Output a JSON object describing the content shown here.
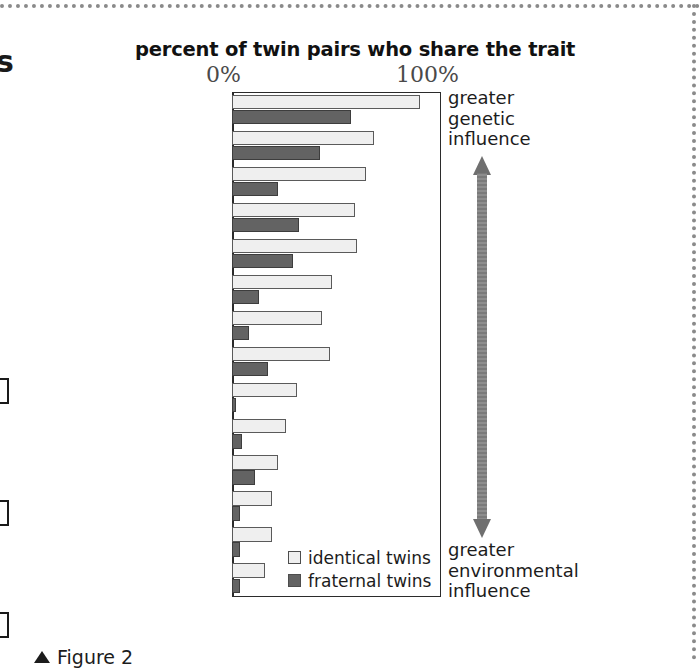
{
  "page": {
    "left_fragment_letter": "s",
    "caption": "Figure 2",
    "caption_icon": "up-triangle-icon"
  },
  "annotations": {
    "top": "greater\ngenetic\ninfluence",
    "top_lines": [
      "greater",
      "genetic",
      "influence"
    ],
    "bottom_lines": [
      "greater",
      "environmental",
      "influence"
    ],
    "arrow": "double-headed-vertical-arrow"
  },
  "legend": {
    "position": "inside-bottom-right",
    "entries": [
      {
        "label": "identical twins",
        "color": "#efefef",
        "key": "identical"
      },
      {
        "label": "fraternal twins",
        "color": "#636363",
        "key": "fraternal"
      }
    ]
  },
  "chart_data": {
    "type": "bar",
    "orientation": "horizontal",
    "title": "percent of twin pairs who share the trait",
    "xlabel": "",
    "ylabel": "",
    "xlim": [
      0,
      100
    ],
    "tick_labels": [
      "0%",
      "100%"
    ],
    "grid": false,
    "categories": [
      "height",
      "reading disability",
      "autism",
      "Alzheimer's",
      "schizophrenia",
      "alcoholism",
      "bipolar disorder",
      "hypertension",
      "diabetes",
      "multiple sclerosis",
      "breast cancer",
      "Crohn's disease",
      "stroke",
      "rheumatoid arthritis"
    ],
    "series": [
      {
        "name": "identical twins",
        "color": "#efefef",
        "values": [
          90,
          68,
          64,
          59,
          60,
          48,
          43,
          47,
          31,
          26,
          22,
          19,
          19,
          16
        ]
      },
      {
        "name": "fraternal twins",
        "color": "#636363",
        "values": [
          57,
          42,
          22,
          32,
          29,
          13,
          8,
          17,
          2,
          5,
          11,
          4,
          4,
          4
        ]
      }
    ]
  }
}
